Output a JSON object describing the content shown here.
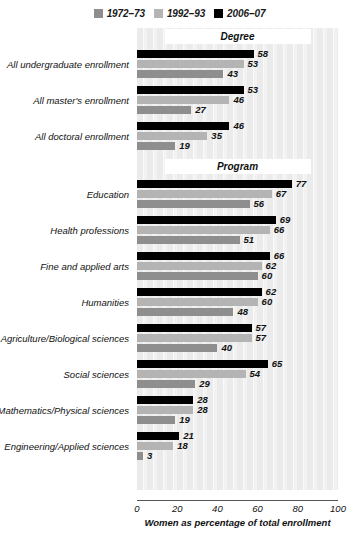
{
  "legend": {
    "items": [
      {
        "label": "1972–73",
        "color": "#8e8e8e",
        "icon": "legend-swatch-icon"
      },
      {
        "label": "1992–93",
        "color": "#b4b4b4",
        "icon": "legend-swatch-icon"
      },
      {
        "label": "2006–07",
        "color": "#000000",
        "icon": "legend-swatch-icon"
      }
    ]
  },
  "sections": [
    {
      "title": "Degree"
    },
    {
      "title": "Program"
    }
  ],
  "axis": {
    "title": "Women as percentage of total enrollment",
    "ticks": [
      "0",
      "20",
      "40",
      "60",
      "80",
      "100"
    ]
  },
  "chart_data": {
    "type": "bar",
    "orientation": "horizontal",
    "title": "",
    "xlabel": "Women as percentage of total enrollment",
    "ylabel": "",
    "xlim": [
      0,
      100
    ],
    "xticks": [
      0,
      20,
      40,
      60,
      80,
      100
    ],
    "grid": false,
    "legend_position": "top-center",
    "series": [
      {
        "name": "1972–73",
        "color": "#8e8e8e",
        "values": [
          43,
          27,
          19,
          56,
          51,
          60,
          48,
          40,
          29,
          19,
          3
        ]
      },
      {
        "name": "1992–93",
        "color": "#b4b4b4",
        "values": [
          53,
          46,
          35,
          67,
          66,
          62,
          60,
          57,
          54,
          28,
          18
        ]
      },
      {
        "name": "2006–07",
        "color": "#000000",
        "values": [
          58,
          53,
          46,
          77,
          69,
          66,
          62,
          57,
          65,
          28,
          21
        ]
      }
    ],
    "categories": [
      "All undergraduate enrollment",
      "All master's enrollment",
      "All doctoral enrollment",
      "Education",
      "Health professions",
      "Fine and applied arts",
      "Humanities",
      "Agriculture/Biological sciences",
      "Social sciences",
      "Mathematics/Physical sciences",
      "Engineering/Applied sciences"
    ],
    "groups": [
      {
        "section": "Degree",
        "categories": [
          "All undergraduate enrollment",
          "All master's enrollment",
          "All doctoral enrollment"
        ]
      },
      {
        "section": "Program",
        "categories": [
          "Education",
          "Health professions",
          "Fine and applied arts",
          "Humanities",
          "Agriculture/Biological sciences",
          "Social sciences",
          "Mathematics/Physical sciences",
          "Engineering/Applied sciences"
        ]
      }
    ]
  }
}
